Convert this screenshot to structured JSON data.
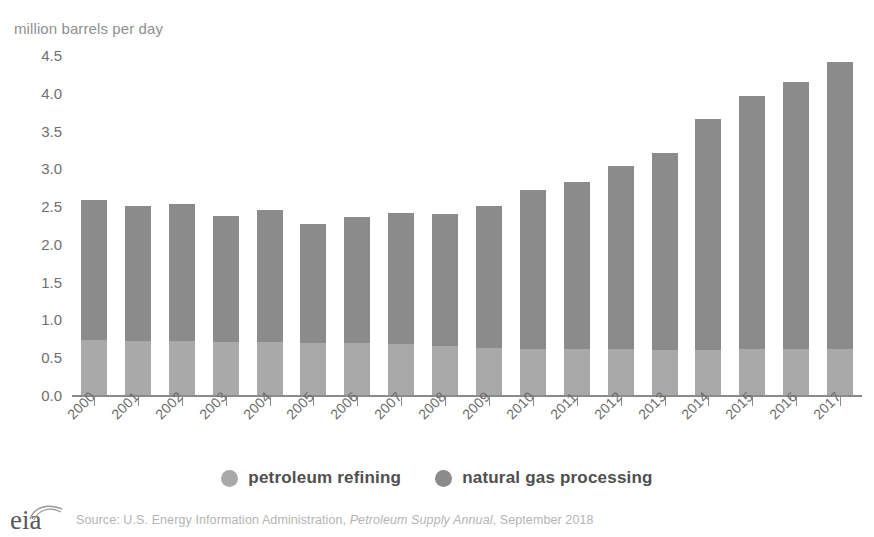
{
  "chart_data": {
    "type": "bar",
    "subtype": "stacked-bar",
    "title": "",
    "axis_title": "million barrels per day",
    "xlabel": "",
    "ylabel": "million barrels per day",
    "ylim": [
      0.0,
      4.5
    ],
    "yticks": [
      "4.5",
      "4.0",
      "3.5",
      "3.0",
      "2.5",
      "2.0",
      "1.5",
      "1.0",
      "0.5",
      "0.0"
    ],
    "ytick_values": [
      4.5,
      4.0,
      3.5,
      3.0,
      2.5,
      2.0,
      1.5,
      1.0,
      0.5,
      0.0
    ],
    "grid": false,
    "legend_position": "bottom-center",
    "categories": [
      "2000",
      "2001",
      "2002",
      "2003",
      "2004",
      "2005",
      "2006",
      "2007",
      "2008",
      "2009",
      "2010",
      "2011",
      "2012",
      "2013",
      "2014",
      "2015",
      "2016",
      "2017"
    ],
    "series": [
      {
        "name": "petroleum refining",
        "color": "#a9a9a9",
        "values": [
          0.74,
          0.73,
          0.73,
          0.72,
          0.71,
          0.7,
          0.7,
          0.69,
          0.66,
          0.64,
          0.62,
          0.62,
          0.62,
          0.61,
          0.61,
          0.62,
          0.62,
          0.62
        ]
      },
      {
        "name": "natural gas processing",
        "color": "#8b8b8b",
        "values": [
          1.86,
          1.79,
          1.81,
          1.66,
          1.75,
          1.58,
          1.67,
          1.73,
          1.75,
          1.88,
          2.11,
          2.21,
          2.43,
          2.61,
          3.06,
          3.35,
          3.53,
          3.8
        ]
      }
    ],
    "totals": [
      2.6,
      2.52,
      2.54,
      2.38,
      2.46,
      2.28,
      2.37,
      2.42,
      2.41,
      2.52,
      2.73,
      2.83,
      3.05,
      3.22,
      3.67,
      3.97,
      4.15,
      4.42
    ]
  },
  "legend": {
    "items": [
      {
        "label": "petroleum refining",
        "color": "#a9a9a9",
        "key": "pr"
      },
      {
        "label": "natural gas processing",
        "color": "#8b8b8b",
        "key": "ngp"
      }
    ]
  },
  "footer": {
    "logo_text": "eia",
    "source_prefix": "Source: U.S. Energy Information Administration, ",
    "source_italic": "Petroleum Supply Annual",
    "source_suffix": ", September 2018"
  },
  "colors": {
    "petroleum_refining": "#a9a9a9",
    "natural_gas_processing": "#8b8b8b",
    "axis": "#8a8a8a",
    "tick_text": "#6b6b6b",
    "axis_title_text": "#8f8f8f",
    "legend_text": "#4f4f4f",
    "source_text": "#b4b4b4",
    "background": "#ffffff"
  }
}
